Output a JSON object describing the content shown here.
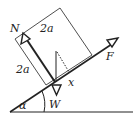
{
  "diagram": {
    "type": "physics-free-body",
    "labels": {
      "normal_force": "N",
      "weight": "W",
      "applied_force": "F",
      "angle": "α",
      "side_top": "2a",
      "side_left": "2a",
      "distance": "x"
    },
    "colors": {
      "line": "#222222",
      "background": "#ffffff"
    }
  }
}
